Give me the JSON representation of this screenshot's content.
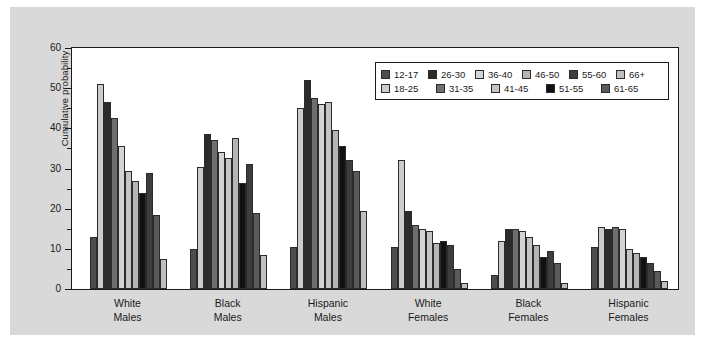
{
  "chart_data": {
    "type": "bar",
    "title": "",
    "xlabel": "",
    "ylabel": "Cumulative probability",
    "ylim": [
      0,
      60
    ],
    "ytick_labels": [
      "0",
      "10",
      "20",
      "30",
      "40",
      "50",
      "60"
    ],
    "ytick_values": [
      0,
      10,
      20,
      30,
      40,
      50,
      60
    ],
    "yminor_values": [
      5,
      15,
      25,
      35,
      45,
      55
    ],
    "grid": false,
    "legend_position": "upper right",
    "categories": [
      "White\nMales",
      "Black\nMales",
      "Hispanic\nMales",
      "White\nFemales",
      "Black\nFemales",
      "Hispanic\nFemales"
    ],
    "series": [
      {
        "name": "12-17",
        "color": "#4d4d4d",
        "values": [
          13.0,
          10.0,
          10.5,
          10.5,
          3.5,
          10.5
        ]
      },
      {
        "name": "18-25",
        "color": "#cccccc",
        "values": [
          51.0,
          30.5,
          45.0,
          32.0,
          12.0,
          15.5
        ]
      },
      {
        "name": "26-30",
        "color": "#2b2b2b",
        "values": [
          46.5,
          38.5,
          52.0,
          19.5,
          15.0,
          15.0
        ]
      },
      {
        "name": "31-35",
        "color": "#6e6e6e",
        "values": [
          42.5,
          37.0,
          47.5,
          16.0,
          15.0,
          15.5
        ]
      },
      {
        "name": "36-40",
        "color": "#d4d4d4",
        "values": [
          35.5,
          34.0,
          46.0,
          15.0,
          14.5,
          15.0
        ]
      },
      {
        "name": "41-45",
        "color": "#c4c4c4",
        "values": [
          29.5,
          32.5,
          46.5,
          14.5,
          13.0,
          10.0
        ]
      },
      {
        "name": "46-50",
        "color": "#b5b5b5",
        "values": [
          27.0,
          37.5,
          39.5,
          11.5,
          11.0,
          9.0
        ]
      },
      {
        "name": "51-55",
        "color": "#111111",
        "values": [
          24.0,
          26.5,
          35.5,
          12.0,
          8.0,
          8.0
        ]
      },
      {
        "name": "55-60",
        "color": "#3d3d3d",
        "values": [
          29.0,
          31.0,
          32.0,
          11.0,
          9.5,
          6.5
        ]
      },
      {
        "name": "61-65",
        "color": "#5a5a5a",
        "values": [
          18.5,
          19.0,
          29.5,
          5.0,
          6.5,
          4.5
        ]
      },
      {
        "name": "66+",
        "color": "#bfbfbf",
        "values": [
          7.5,
          8.5,
          19.5,
          1.5,
          1.5,
          2.0
        ]
      }
    ]
  },
  "legend": {
    "row1": [
      "12-17",
      "26-30",
      "36-40",
      "46-50",
      "55-60",
      "66+"
    ],
    "row2": [
      "18-25",
      "31-35",
      "41-45",
      "51-55",
      "61-65"
    ]
  },
  "colors": {
    "figure_background": "#d9d9d9",
    "plot_background": "#ffffff",
    "axis": "#1a1a1a"
  }
}
